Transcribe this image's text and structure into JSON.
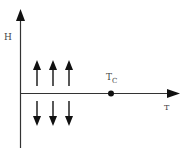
{
  "diagram": {
    "y_axis_label": "H",
    "x_axis_label": "T",
    "critical_point": {
      "label_main": "T",
      "label_sub": "C"
    },
    "up_arrows": 3,
    "down_arrows": 3,
    "colors": {
      "axis": "#333333",
      "arrow": "#111111",
      "text": "#444444"
    }
  }
}
